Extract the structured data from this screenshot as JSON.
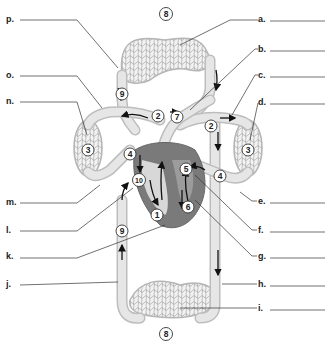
{
  "diagram": {
    "labels_right": [
      "a.",
      "b.",
      "c.",
      "d.",
      "e.",
      "f.",
      "g.",
      "h.",
      "i."
    ],
    "labels_left": [
      "p.",
      "o.",
      "n.",
      "m.",
      "l.",
      "k.",
      "j."
    ],
    "numbers": {
      "top_capillary": "8",
      "bottom_capillary": "8",
      "upper_vein_top": "9",
      "left_pulmonary_artery": "2",
      "right_pulmonary_artery": "2",
      "aorta_arch": "7",
      "left_lung": "3",
      "right_lung": "3",
      "left_pulmonary_vein": "4",
      "right_pulmonary_vein": "4",
      "left_atrium": "5",
      "right_atrium": "10",
      "left_ventricle": "6",
      "right_ventricle": "1",
      "lower_vena_cava": "9"
    }
  }
}
